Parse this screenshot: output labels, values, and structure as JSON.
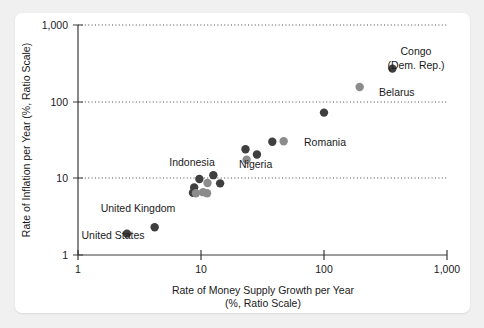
{
  "chart_data": {
    "type": "scatter",
    "title": "",
    "xlabel": "Rate of Money Supply Growth per Year",
    "xlabel_line2": "(%, Ratio Scale)",
    "ylabel": "Rate of Inflation per Year (%, Ratio Scale)",
    "xscale": "log",
    "yscale": "log",
    "xlim": [
      1,
      1000
    ],
    "ylim": [
      1,
      1000
    ],
    "xticks": [
      "1",
      "10",
      "100",
      "1,000"
    ],
    "xtick_values": [
      1,
      10,
      100,
      1000
    ],
    "yticks": [
      "1,000",
      "100",
      "10",
      "1"
    ],
    "ytick_values": [
      1000,
      100,
      10,
      1
    ],
    "grid": "horizontal-dotted",
    "legend": "none",
    "colors": {
      "dark_marker": "#3f3f3f",
      "light_marker": "#8c8c8c",
      "axis": "#3a3a3a",
      "text": "#1a1a1a",
      "card": "#ffffff",
      "page_background": "#f0f0f0"
    },
    "points": [
      {
        "label": "United States",
        "x": 2.5,
        "y": 1.9,
        "shade": "dark"
      },
      {
        "label": "United Kingdom",
        "x": 4.2,
        "y": 2.3,
        "shade": "dark"
      },
      {
        "label": "",
        "x": 8.6,
        "y": 6.5,
        "shade": "dark"
      },
      {
        "label": "",
        "x": 8.8,
        "y": 7.6,
        "shade": "dark"
      },
      {
        "label": "",
        "x": 9.1,
        "y": 6.4,
        "shade": "light"
      },
      {
        "label": "Indonesia",
        "x": 9.7,
        "y": 9.8,
        "shade": "dark"
      },
      {
        "label": "",
        "x": 10.4,
        "y": 6.6,
        "shade": "light"
      },
      {
        "label": "",
        "x": 11.2,
        "y": 6.4,
        "shade": "light"
      },
      {
        "label": "",
        "x": 11.3,
        "y": 8.7,
        "shade": "light"
      },
      {
        "label": "",
        "x": 12.6,
        "y": 11.0,
        "shade": "dark"
      },
      {
        "label": "",
        "x": 14.3,
        "y": 8.6,
        "shade": "dark"
      },
      {
        "label": "Nigeria",
        "x": 23.0,
        "y": 24.0,
        "shade": "dark"
      },
      {
        "label": "",
        "x": 23.5,
        "y": 17.5,
        "shade": "light"
      },
      {
        "label": "",
        "x": 28.5,
        "y": 20.5,
        "shade": "dark"
      },
      {
        "label": "",
        "x": 38.0,
        "y": 30.0,
        "shade": "dark"
      },
      {
        "label": "Romania",
        "x": 47.0,
        "y": 30.5,
        "shade": "light"
      },
      {
        "label": "",
        "x": 100.0,
        "y": 72.0,
        "shade": "dark"
      },
      {
        "label": "Belarus",
        "x": 195.0,
        "y": 155.0,
        "shade": "light"
      },
      {
        "label": "Congo (Dem. Rep.)",
        "x": 360.0,
        "y": 270.0,
        "shade": "dark"
      }
    ],
    "annotations": [
      {
        "name": "congo-label",
        "text_line1": "Congo",
        "text_line2": "(Dem. Rep.)"
      },
      {
        "name": "belarus-label",
        "text": "Belarus"
      },
      {
        "name": "romania-label",
        "text": "Romania"
      },
      {
        "name": "nigeria-label",
        "text": "Nigeria"
      },
      {
        "name": "indonesia-label",
        "text": "Indonesia"
      },
      {
        "name": "united-kingdom-label",
        "text": "United Kingdom"
      },
      {
        "name": "united-states-label",
        "text": "United States"
      }
    ]
  },
  "labels": {
    "congo_line1": "Congo",
    "congo_line2": "(Dem. Rep.)",
    "belarus": "Belarus",
    "romania": "Romania",
    "nigeria": "Nigeria",
    "indonesia": "Indonesia",
    "united_kingdom": "United Kingdom",
    "united_states": "United States"
  },
  "axes": {
    "x_title": "Rate of Money Supply Growth per Year",
    "x_subtitle": "(%, Ratio Scale)",
    "y_title": "Rate of Inflation per Year (%, Ratio Scale)",
    "x_tick_1": "1",
    "x_tick_10": "10",
    "x_tick_100": "100",
    "x_tick_1000": "1,000",
    "y_tick_1": "1",
    "y_tick_10": "10",
    "y_tick_100": "100",
    "y_tick_1000": "1,000"
  }
}
